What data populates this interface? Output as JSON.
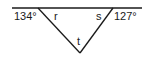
{
  "diagram": {
    "type": "geometry-triangle",
    "line": {
      "x1": 12,
      "y1": 8,
      "x2": 142,
      "y2": 8
    },
    "vertices": {
      "left": {
        "x": 38,
        "y": 8
      },
      "right": {
        "x": 113,
        "y": 8
      },
      "bottom": {
        "x": 80,
        "y": 53
      }
    },
    "labels": {
      "left_exterior": "134°",
      "right_exterior": "127°",
      "angle_r": "r",
      "angle_s": "s",
      "angle_t": "t"
    },
    "colors": {
      "stroke": "#1a1a1a",
      "text": "#1a1a1a",
      "background": "#ffffff"
    }
  }
}
